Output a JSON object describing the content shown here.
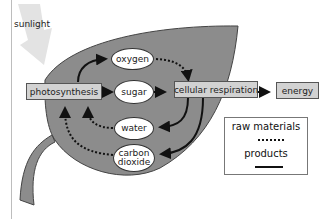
{
  "diagram": {
    "title_hint": "Photosynthesis and cellular respiration cycle in a leaf",
    "sunlight_label": "sunlight",
    "processes": {
      "photosynthesis": "photosynthesis",
      "cellular_respiration": "cellular respiration",
      "energy": "energy"
    },
    "molecules": {
      "oxygen": "oxygen",
      "sugar": "sugar",
      "water": "water",
      "carbon_dioxide_line1": "carbon",
      "carbon_dioxide_line2": "dioxide"
    },
    "legend": {
      "raw_materials": "raw materials",
      "products": "products"
    },
    "colors": {
      "leaf": "#8c8c8c",
      "leaf_outline": "#444444",
      "process_box": "#d2d2d2",
      "sunlight_arrow": "#e3e3e3",
      "arrow": "#111111"
    }
  }
}
